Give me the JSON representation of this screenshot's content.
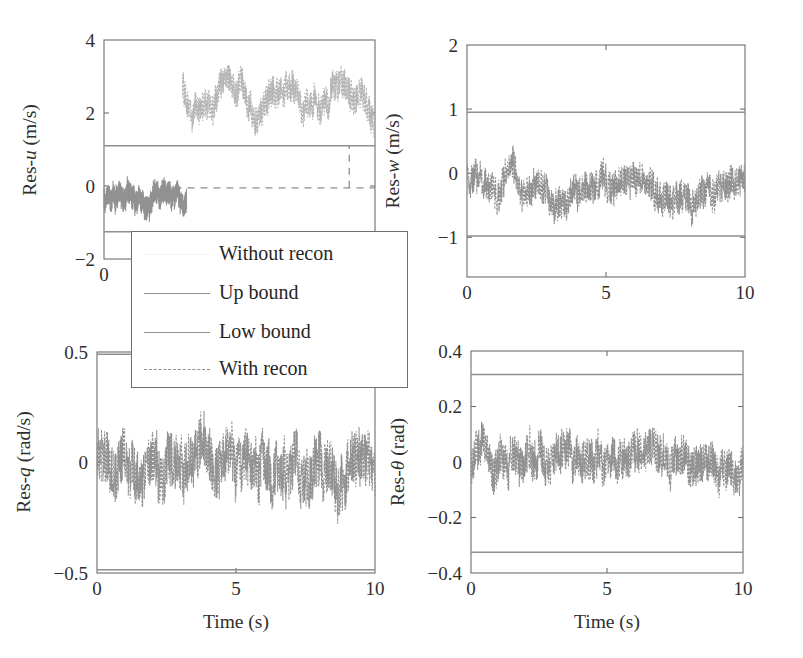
{
  "figure": {
    "width": 803,
    "height": 658,
    "background": "#ffffff",
    "data_color": "#919191",
    "bound_color": "#8e8e8e",
    "recon_color": "#b3b3b3",
    "frame_color": "#6d6d6d"
  },
  "legend": {
    "entries": [
      {
        "label": "Without recon",
        "style": "faint-solid"
      },
      {
        "label": "Up bound",
        "style": "solid"
      },
      {
        "label": "Low bound",
        "style": "solid"
      },
      {
        "label": "With recon",
        "style": "dashed"
      }
    ]
  },
  "chart_data": [
    {
      "id": "res-u",
      "type": "line",
      "position": "top-left",
      "title": "",
      "ylabel": "Res-u (m/s)",
      "ylabel_parts": {
        "prefix": "Res-",
        "italic": "u",
        "suffix": " (m/s)"
      },
      "xlabel": "",
      "xlim": [
        0,
        10
      ],
      "ylim": [
        -2,
        4
      ],
      "xticks": [
        0
      ],
      "xticklabels": [
        "0"
      ],
      "yticks": [
        -2,
        0,
        2,
        4
      ],
      "yticklabels": [
        "-2",
        "0",
        "2",
        "4"
      ],
      "grid": false,
      "up_bound": 1.1,
      "low_bound": -1.25,
      "series": [
        {
          "name": "Without recon",
          "style": "solid",
          "x_range": [
            0,
            3.05
          ],
          "mean": -0.3,
          "noise_amplitude": 0.42,
          "note": "dense noisy band centered near -0.3, only present for t < ~3 s"
        },
        {
          "name": "With recon",
          "style": "dotted",
          "x_range": [
            2.9,
            10
          ],
          "mean": 2.45,
          "noise_amplitude": 0.55,
          "note": "oscillating dotted cloud between ~1.8 and ~3.3 for t > ~3 s"
        },
        {
          "name": "With recon flat",
          "style": "dashed-flat",
          "x_range": [
            2.6,
            10
          ],
          "value": -0.05,
          "step_x": 9.05,
          "step_to": 1.1,
          "note": "flat dashed line near 0 with a vertical dashed jump up to the up bound near t = 9"
        }
      ]
    },
    {
      "id": "res-w",
      "type": "line",
      "position": "top-right",
      "title": "",
      "ylabel": "Res-w (m/s)",
      "ylabel_parts": {
        "prefix": "Res-",
        "italic": "w",
        "suffix": " (m/s)"
      },
      "xlabel": "",
      "xlim": [
        0,
        10
      ],
      "ylim": [
        -1.62,
        2
      ],
      "xticks": [
        0,
        5,
        10
      ],
      "xticklabels": [
        "0",
        "5",
        "10"
      ],
      "yticks": [
        -1,
        0,
        1,
        2
      ],
      "yticklabels": [
        "-1",
        "0",
        "1",
        "2"
      ],
      "grid": false,
      "up_bound": 0.95,
      "low_bound": -0.98,
      "series": [
        {
          "name": "With recon",
          "style": "dashed",
          "x_range": [
            0,
            10
          ],
          "mean": -0.22,
          "noise_amplitude": 0.35,
          "note": "noisy residual band mostly between -0.9 and +0.9; dip toward -0.9 near t = 1, bump near t = 1.6"
        }
      ]
    },
    {
      "id": "res-q",
      "type": "line",
      "position": "bottom-left",
      "title": "",
      "ylabel": "Res-q (rad/s)",
      "ylabel_parts": {
        "prefix": "Res-",
        "italic": "q",
        "suffix": " (rad/s)"
      },
      "xlabel": "Time (s)",
      "xlim": [
        0,
        10
      ],
      "ylim": [
        -0.5,
        0.5
      ],
      "xticks": [
        0,
        5,
        10
      ],
      "xticklabels": [
        "0",
        "5",
        "10"
      ],
      "yticks": [
        -0.5,
        0,
        0.5
      ],
      "yticklabels": [
        "-0.5",
        "0",
        "0.5"
      ],
      "grid": false,
      "up_bound": 0.49,
      "low_bound": -0.485,
      "series": [
        {
          "name": "With recon",
          "style": "dashed",
          "x_range": [
            0,
            10
          ],
          "mean": 0.0,
          "noise_amplitude": 0.17,
          "note": "dense noisy residual filling nearly the whole band between the bounds"
        }
      ]
    },
    {
      "id": "res-theta",
      "type": "line",
      "position": "bottom-right",
      "title": "",
      "ylabel": "Res-θ (rad)",
      "ylabel_parts": {
        "prefix": "Res-",
        "italic": "θ",
        "suffix": " (rad)"
      },
      "xlabel": "Time (s)",
      "xlim": [
        0,
        10
      ],
      "ylim": [
        -0.4,
        0.4
      ],
      "xticks": [
        0,
        5,
        10
      ],
      "xticklabels": [
        "0",
        "5",
        "10"
      ],
      "yticks": [
        -0.4,
        -0.2,
        0,
        0.2,
        0.4
      ],
      "yticklabels": [
        "-0.4",
        "-0.2",
        "0",
        "0.2",
        "0.4"
      ],
      "grid": false,
      "up_bound": 0.315,
      "low_bound": -0.325,
      "series": [
        {
          "name": "With recon",
          "style": "dashed",
          "x_range": [
            0,
            10
          ],
          "mean": 0.005,
          "noise_amplitude": 0.1,
          "note": "noisy residual band mostly within +/-0.25"
        }
      ]
    }
  ]
}
